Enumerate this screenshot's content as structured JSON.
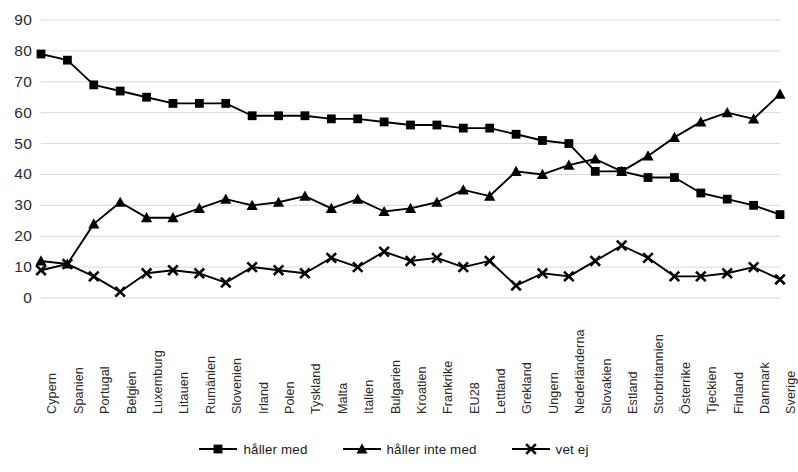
{
  "chart_data": {
    "type": "line",
    "title": "",
    "subtitle": "",
    "xlabel": "",
    "ylabel": "",
    "ylim": [
      0,
      90
    ],
    "yticks": [
      0,
      10,
      20,
      30,
      40,
      50,
      60,
      70,
      80,
      90
    ],
    "grid": true,
    "legend_position": "bottom",
    "categories": [
      "Cypern",
      "Spanien",
      "Portugal",
      "Belgien",
      "Luxemburg",
      "Litauen",
      "Rumänien",
      "Slovenien",
      "Irland",
      "Polen",
      "Tyskland",
      "Malta",
      "Italien",
      "Bulgarien",
      "Kroatien",
      "Frankrike",
      "EU28",
      "Lettland",
      "Grekland",
      "Ungern",
      "Nederländerna",
      "Slovakien",
      "Estland",
      "Storbritannien",
      "Österrike",
      "Tjeckien",
      "Finland",
      "Danmark",
      "Sverige"
    ],
    "series": [
      {
        "name": "håller med",
        "marker": "square",
        "color": "#000000",
        "values": [
          79,
          77,
          69,
          67,
          65,
          63,
          63,
          63,
          59,
          59,
          59,
          58,
          58,
          57,
          56,
          56,
          55,
          55,
          53,
          51,
          50,
          41,
          41,
          39,
          39,
          34,
          32,
          30,
          27
        ]
      },
      {
        "name": "håller inte med",
        "marker": "triangle",
        "color": "#000000",
        "values": [
          12,
          11,
          24,
          31,
          26,
          26,
          29,
          32,
          30,
          31,
          33,
          29,
          32,
          28,
          29,
          31,
          35,
          33,
          41,
          40,
          43,
          45,
          41,
          46,
          52,
          57,
          60,
          58,
          66
        ]
      },
      {
        "name": "vet ej",
        "marker": "x",
        "color": "#000000",
        "values": [
          9,
          11,
          7,
          2,
          8,
          9,
          8,
          5,
          10,
          9,
          8,
          13,
          10,
          15,
          12,
          13,
          10,
          12,
          4,
          8,
          7,
          12,
          17,
          13,
          7,
          7,
          8,
          10,
          6
        ]
      }
    ]
  },
  "legend": {
    "items": [
      {
        "label": "håller med",
        "marker": "square-marker"
      },
      {
        "label": "håller inte med",
        "marker": "triangle-marker"
      },
      {
        "label": "vet ej",
        "marker": "x-marker"
      }
    ]
  },
  "style": {
    "line_color": "#000000",
    "grid_color": "#d9d9d9",
    "text_color": "#2b2b2b",
    "background": "#ffffff"
  }
}
